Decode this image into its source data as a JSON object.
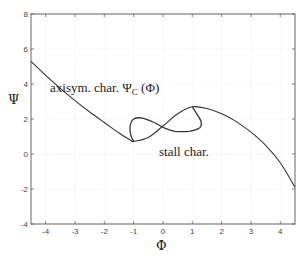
{
  "chart_data": {
    "type": "line",
    "title": "",
    "xlabel": "Φ",
    "ylabel": "Ψ",
    "xlim": [
      -4.5,
      4.5
    ],
    "ylim": [
      -4,
      8
    ],
    "grid": true,
    "x_ticks": [
      -4,
      -3,
      -2,
      -1,
      0,
      1,
      2,
      3,
      4
    ],
    "y_ticks": [
      -4,
      -2,
      0,
      2,
      4,
      6,
      8
    ],
    "x_tick_labels": [
      "-4",
      "-3",
      "-2",
      "-1",
      "0",
      "1",
      "2",
      "3",
      "4"
    ],
    "y_tick_labels": [
      "-4",
      "-2",
      "0",
      "2",
      "4",
      "6",
      "8"
    ],
    "series": [
      {
        "name": "axisym. char.",
        "x": [
          -4.5,
          -4,
          -3.5,
          -3,
          -2.5,
          -2,
          -1.5,
          -1.1,
          -1,
          -0.5,
          0,
          0.5,
          1,
          1.5,
          2,
          2.5,
          3,
          3.5,
          4,
          4.5
        ],
        "y": [
          5.3,
          4.5,
          3.75,
          3.05,
          2.4,
          1.8,
          1.2,
          0.78,
          0.72,
          0.95,
          1.6,
          2.3,
          2.7,
          2.6,
          2.3,
          1.85,
          1.25,
          0.5,
          -0.5,
          -1.9
        ]
      },
      {
        "name": "stall char.",
        "x": [
          -1,
          -1.1,
          -1.12,
          -1.0,
          -0.7,
          -0.3,
          0.1,
          0.4,
          0.9,
          1.25,
          1.3,
          1.15,
          1
        ],
        "y": [
          0.72,
          1.1,
          1.6,
          2.0,
          2.05,
          1.8,
          1.45,
          1.3,
          1.3,
          1.5,
          1.85,
          2.3,
          2.7
        ]
      }
    ],
    "annotations": [
      {
        "text": "axisym. char. Ψ_C (Φ)",
        "x": -3.8,
        "y": 3.7
      },
      {
        "text": "stall char.",
        "x": -0.1,
        "y": -0.1
      }
    ]
  },
  "labels": {
    "x_axis": "Φ",
    "y_axis": "Ψ",
    "annot_axisym_prefix": "axisym. char. Ψ",
    "annot_axisym_sub": "C",
    "annot_axisym_suffix": " (Φ)",
    "annot_stall": "stall char."
  }
}
